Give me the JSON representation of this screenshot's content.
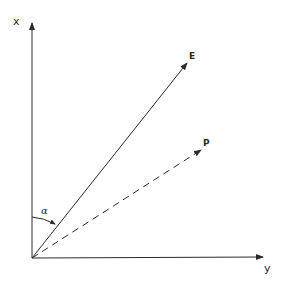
{
  "diagram": {
    "type": "vector-diagram",
    "colors": {
      "ink": "#2a2a2a",
      "background": "#ffffff"
    },
    "origin": {
      "x": 32,
      "y": 258
    },
    "axes": {
      "x_axis": {
        "label": "x",
        "direction": "up",
        "tip": {
          "x": 32,
          "y": 22
        }
      },
      "y_axis": {
        "label": "y",
        "direction": "right",
        "tip": {
          "x": 264,
          "y": 257
        }
      }
    },
    "vectors": [
      {
        "name": "E",
        "label": "E",
        "style": "solid",
        "tip": {
          "x": 188,
          "y": 62
        }
      },
      {
        "name": "P",
        "label": "P",
        "style": "dashed",
        "tip": {
          "x": 202,
          "y": 149
        }
      }
    ],
    "angle": {
      "label": "α",
      "between": [
        "x",
        "E"
      ]
    }
  }
}
